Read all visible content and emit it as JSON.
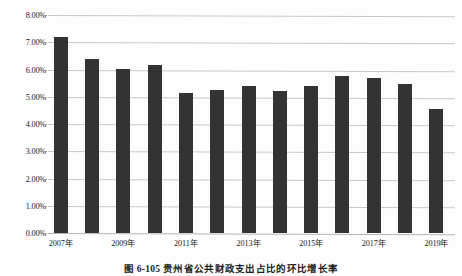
{
  "chart_data": {
    "type": "bar",
    "title": "",
    "xlabel": "",
    "ylabel": "",
    "categories": [
      "2007年",
      "2008年",
      "2009年",
      "2010年",
      "2011年",
      "2012年",
      "2013年",
      "2014年",
      "2015年",
      "2016年",
      "2017年",
      "2018年",
      "2019年"
    ],
    "values": [
      7.2,
      6.4,
      6.02,
      6.15,
      5.15,
      5.25,
      5.38,
      5.22,
      5.38,
      5.75,
      5.68,
      5.47,
      4.55
    ],
    "value_unit": "%",
    "ylim": [
      0,
      8
    ],
    "ytick_labels": [
      "8.00%",
      "7.00%",
      "6.00%",
      "5.00%",
      "4.00%",
      "3.00%",
      "2.00%",
      "1.00%",
      "0.00%"
    ],
    "ytick_values": [
      8,
      7,
      6,
      5,
      4,
      3,
      2,
      1,
      0
    ],
    "visible_xtick_labels": [
      "2007年",
      "2009年",
      "2011年",
      "2013年",
      "2015年",
      "2017年",
      "2019年"
    ],
    "visible_xtick_indices": [
      0,
      2,
      4,
      6,
      8,
      10,
      12
    ],
    "grid": true,
    "legend": "none",
    "bar_color": "#333333",
    "gridline_color": "#c8c8c8"
  },
  "caption": {
    "text": "图 6-105  贵州省公共财政支出占比的环比增长率"
  }
}
